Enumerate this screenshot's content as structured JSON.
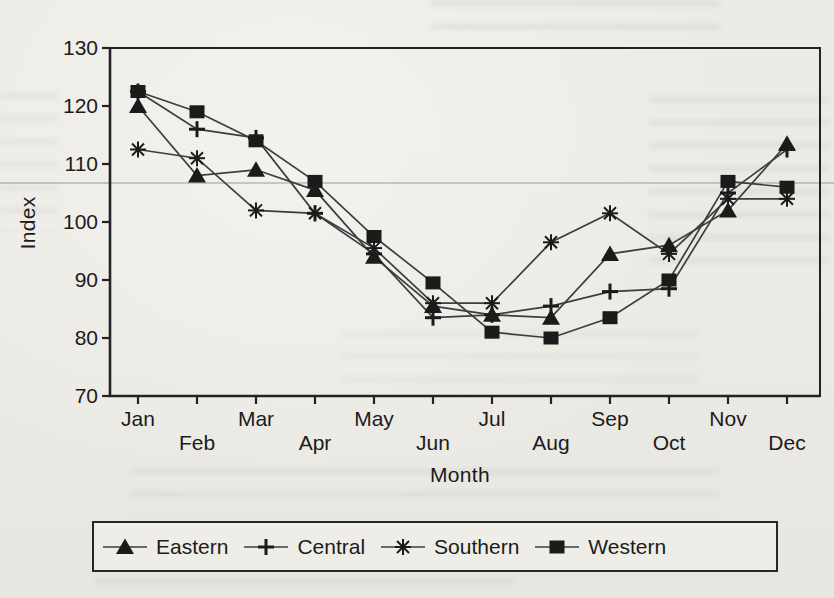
{
  "colors": {
    "ink": "#1b1b1b",
    "series_line": "#3d3d40",
    "paper": "#edebe5",
    "frame": "#232327"
  },
  "chart_data": {
    "type": "line",
    "title": "",
    "xlabel": "Month",
    "ylabel": "Index",
    "ylim": [
      70,
      130
    ],
    "yticks": [
      70,
      80,
      90,
      100,
      110,
      120,
      130
    ],
    "categories": [
      "Jan",
      "Feb",
      "Mar",
      "Apr",
      "May",
      "Jun",
      "Jul",
      "Aug",
      "Sep",
      "Oct",
      "Nov",
      "Dec"
    ],
    "x_labels_staggered": true,
    "grid": false,
    "legend_position": "bottom",
    "series": [
      {
        "name": "Eastern",
        "marker": "triangle",
        "values": [
          120,
          108,
          109,
          105.5,
          94,
          85.5,
          84,
          83.5,
          94.5,
          96,
          102,
          113.5
        ]
      },
      {
        "name": "Central",
        "marker": "plus",
        "values": [
          122.5,
          116,
          114.5,
          101.5,
          94.5,
          83.5,
          84,
          85.5,
          88,
          88.5,
          105,
          112.5
        ]
      },
      {
        "name": "Southern",
        "marker": "asterisk",
        "values": [
          112.5,
          111,
          102,
          101.5,
          95.5,
          86,
          86,
          96.5,
          101.5,
          94.5,
          104,
          104
        ]
      },
      {
        "name": "Western",
        "marker": "square",
        "values": [
          122.5,
          119,
          114,
          107,
          97.5,
          89.5,
          81,
          80,
          83.5,
          90,
          107,
          106
        ]
      }
    ]
  }
}
